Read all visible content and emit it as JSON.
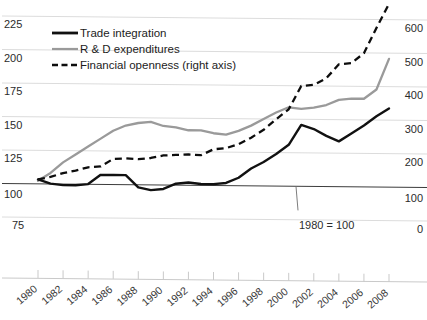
{
  "chart_data": {
    "type": "line",
    "title": "",
    "subtitle": "",
    "xlabel": "",
    "ylabel": "",
    "y2label": "",
    "annotation": "1980 = 100",
    "grid": true,
    "legend_position": "top-left",
    "x": [
      1980,
      1981,
      1982,
      1983,
      1984,
      1985,
      1986,
      1987,
      1988,
      1989,
      1990,
      1991,
      1992,
      1993,
      1994,
      1995,
      1996,
      1997,
      1998,
      1999,
      2000,
      2001,
      2002,
      2003,
      2004,
      2005,
      2006,
      2007,
      2008
    ],
    "x_tick_labels": [
      "1980",
      "1982",
      "1984",
      "1986",
      "1988",
      "1990",
      "1992",
      "1994",
      "1996",
      "1998",
      "2000",
      "2002",
      "2004",
      "2006",
      "2008"
    ],
    "y_tick_labels": [
      "225",
      "200",
      "175",
      "150",
      "125",
      "100",
      "75"
    ],
    "y2_tick_labels": [
      "600",
      "500",
      "400",
      "300",
      "200",
      "100",
      "0"
    ],
    "ylim": [
      75,
      237
    ],
    "y2lim": [
      0,
      648
    ],
    "series": [
      {
        "name": "Trade integration",
        "axis": "left",
        "style": "solid",
        "color": "#111111",
        "values": [
          103,
          100,
          99,
          99,
          100,
          107,
          107,
          107,
          98,
          96,
          97,
          101,
          102,
          101,
          101,
          102,
          106,
          113,
          118,
          124,
          131,
          146,
          143,
          138,
          134,
          140,
          146,
          153,
          159
        ]
      },
      {
        "name": "R & D expenditures",
        "axis": "left",
        "style": "solid",
        "color": "#9a9a9a",
        "values": [
          102,
          108,
          116,
          122,
          128,
          134,
          140,
          144,
          146,
          147,
          144,
          143,
          141,
          141,
          139,
          138,
          141,
          145,
          150,
          155,
          159,
          158,
          159,
          161,
          165,
          166,
          166,
          173,
          196
        ]
      },
      {
        "name": "Financial openness (right axis)",
        "axis": "right",
        "style": "dashed",
        "color": "#0d0d0d",
        "values": [
          112,
          120,
          132,
          140,
          150,
          153,
          176,
          178,
          176,
          180,
          188,
          190,
          192,
          190,
          208,
          212,
          224,
          244,
          268,
          300,
          330,
          400,
          404,
          424,
          466,
          470,
          500,
          576,
          648
        ]
      }
    ]
  },
  "legend": {
    "items": [
      {
        "label": "Trade integration",
        "style": "solid-dark"
      },
      {
        "label": "R & D expenditures",
        "style": "solid-gray"
      },
      {
        "label": "Financial openness (right axis)",
        "style": "dashed"
      }
    ]
  },
  "annotation": {
    "text": "1980 = 100"
  },
  "colors": {
    "trade": "#111111",
    "rnd": "#9a9a9a",
    "financial": "#0d0d0d",
    "grid": "#dcdcdc",
    "baseline": "#3c3c3c"
  }
}
